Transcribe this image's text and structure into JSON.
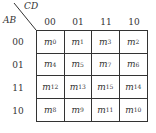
{
  "kmap": {
    "col_var": "CD",
    "row_var": "AB",
    "col_labels": [
      "00",
      "01",
      "11",
      "10"
    ],
    "row_labels": [
      "00",
      "01",
      "11",
      "10"
    ],
    "cells": [
      [
        {
          "base": "m",
          "sub": "0"
        },
        {
          "base": "m",
          "sub": "1"
        },
        {
          "base": "m",
          "sub": "3"
        },
        {
          "base": "m",
          "sub": "2"
        }
      ],
      [
        {
          "base": "m",
          "sub": "4"
        },
        {
          "base": "m",
          "sub": "5"
        },
        {
          "base": "m",
          "sub": "7"
        },
        {
          "base": "m",
          "sub": "6"
        }
      ],
      [
        {
          "base": "m",
          "sub": "12"
        },
        {
          "base": "m",
          "sub": "13"
        },
        {
          "base": "m",
          "sub": "15"
        },
        {
          "base": "m",
          "sub": "14"
        }
      ],
      [
        {
          "base": "m",
          "sub": "8"
        },
        {
          "base": "m",
          "sub": "9"
        },
        {
          "base": "m",
          "sub": "11"
        },
        {
          "base": "m",
          "sub": "10"
        }
      ]
    ]
  }
}
